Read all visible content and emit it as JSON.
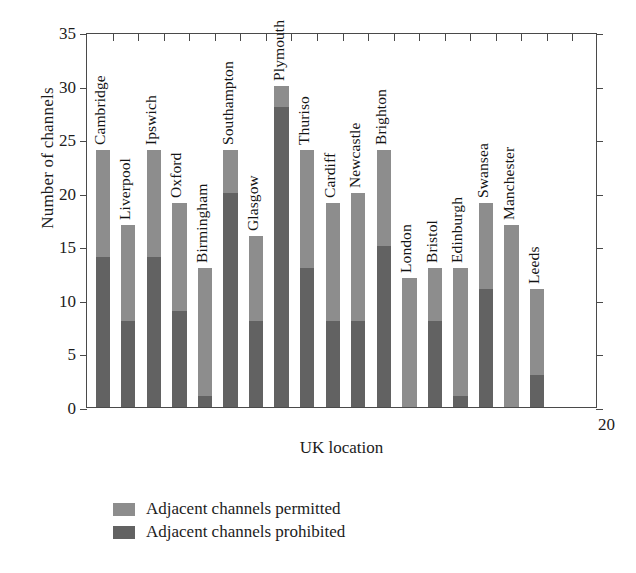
{
  "chart_data": {
    "type": "bar",
    "subtype": "stacked-bar",
    "title": "",
    "xlabel": "UK location",
    "ylabel": "Number of channels",
    "ylim": [
      0,
      35
    ],
    "yticks": [
      0,
      5,
      10,
      15,
      20,
      25,
      30,
      35
    ],
    "grid": false,
    "legend_position": "below-axes-left",
    "categories": [
      "Cambridge",
      "Liverpool",
      "Ipswich",
      "Oxford",
      "Birmingham",
      "Southampton",
      "Glasgow",
      "Plymouth",
      "Thuriso",
      "Cardiff",
      "Newcastle",
      "Brighton",
      "London",
      "Bristol",
      "Edinburgh",
      "Swansea",
      "Manchester",
      "Leeds"
    ],
    "series": [
      {
        "name": "Adjacent channels permitted",
        "color": "#8d8d8d",
        "values": [
          24,
          17,
          24,
          19,
          13,
          24,
          16,
          30,
          24,
          19,
          20,
          24,
          12,
          13,
          13,
          19,
          17,
          11
        ]
      },
      {
        "name": "Adjacent channels prohibited",
        "color": "#626262",
        "values": [
          14,
          8,
          14,
          9,
          1,
          20,
          8,
          28,
          13,
          8,
          8,
          15,
          0,
          8,
          1,
          11,
          0,
          3
        ]
      }
    ],
    "annotations": [
      {
        "text": "20",
        "position": "bottom-right-outside"
      }
    ]
  },
  "legend": {
    "items": [
      {
        "label": "Adjacent channels permitted",
        "color": "#8d8d8d"
      },
      {
        "label": "Adjacent channels prohibited",
        "color": "#626262"
      }
    ]
  }
}
